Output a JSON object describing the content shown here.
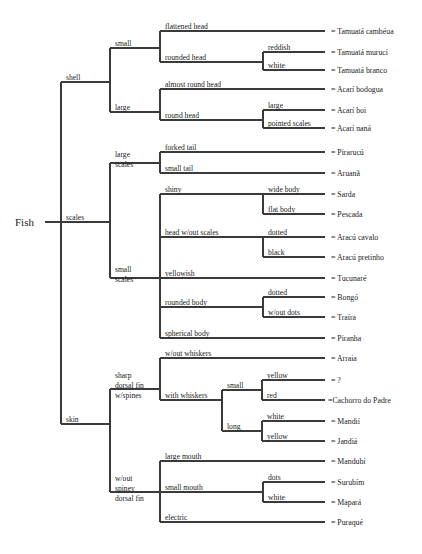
{
  "figure": {
    "root_label": "Fish",
    "leaf_prefix": "=",
    "caption": ""
  },
  "geometry": {
    "width": 422,
    "height": 554,
    "root_x": 61,
    "level_x": [
      61,
      110,
      160,
      263,
      300
    ],
    "leaf_line_end": 325,
    "leaf_text_x": 331,
    "root_text_x": 15,
    "root_y": 222
  },
  "levels": {
    "l1_label_x": 66,
    "l2_label_x": 115,
    "l3_label_x": 165,
    "l4_label_x": 268,
    "l5_label_x": 305
  },
  "branches": [
    {
      "id": "shell",
      "label": "shell",
      "label_x": 66,
      "y": 82,
      "spine_x": 110,
      "spine_top": 48,
      "spine_bottom": 112,
      "children": [
        {
          "id": "shell-small",
          "label": "small",
          "label_x": 115,
          "y": 48,
          "spine_x": 160,
          "spine_top": 31,
          "spine_bottom": 62,
          "children": [
            {
              "id": "flattened-head",
              "label": "flattened head",
              "label_x": 165,
              "y": 31,
              "leaf": "Tamuatá cambéua"
            },
            {
              "id": "rounded-head",
              "label": "rounded head",
              "label_x": 165,
              "y": 62,
              "spine_x": 263,
              "spine_top": 52,
              "spine_bottom": 70,
              "children": [
                {
                  "id": "reddish",
                  "label": "reddish",
                  "label_x": 268,
                  "y": 52,
                  "leaf": "Tamuatá murucí"
                },
                {
                  "id": "white-tamuata",
                  "label": "white",
                  "label_x": 268,
                  "y": 70,
                  "leaf": "Tamuatá branco"
                }
              ]
            }
          ]
        },
        {
          "id": "shell-large",
          "label": "large",
          "label_x": 115,
          "y": 112,
          "spine_x": 160,
          "spine_top": 89,
          "spine_bottom": 120,
          "children": [
            {
              "id": "almost-round-head",
              "label": "almost round head",
              "label_x": 165,
              "y": 89,
              "leaf": "Acarí  bodogua"
            },
            {
              "id": "round-head",
              "label": "round head",
              "label_x": 165,
              "y": 120,
              "spine_x": 263,
              "spine_top": 110,
              "spine_bottom": 128,
              "children": [
                {
                  "id": "acari-large",
                  "label": "large",
                  "label_x": 268,
                  "y": 110,
                  "leaf": "Acarí  boi"
                },
                {
                  "id": "pointed-scales",
                  "label": "pointed scales",
                  "label_x": 268,
                  "y": 128,
                  "leaf": "Acarí  naná"
                }
              ]
            }
          ]
        }
      ]
    },
    {
      "id": "scales",
      "label": "scales",
      "label_x": 66,
      "y": 222,
      "spine_x": 110,
      "spine_top": 163,
      "spine_bottom": 278,
      "children": [
        {
          "id": "large-scales",
          "label": "large\nscales",
          "label_x": 115,
          "y": 163,
          "spine_x": 160,
          "spine_top": 152,
          "spine_bottom": 173,
          "children": [
            {
              "id": "forked-tail",
              "label": "forked tail",
              "label_x": 165,
              "y": 152,
              "leaf": "Pirarucú"
            },
            {
              "id": "small-tail",
              "label": "small tail",
              "label_x": 165,
              "y": 173,
              "leaf": "Aruanã"
            }
          ]
        },
        {
          "id": "small-scales",
          "label": "small\nscales",
          "label_x": 115,
          "y": 278,
          "spine_x": 160,
          "spine_top": 194,
          "spine_bottom": 338,
          "children": [
            {
              "id": "shiny",
              "label": "shiny",
              "label_x": 165,
              "y": 194,
              "spine_x": 263,
              "spine_top": 194,
              "spine_bottom": 214,
              "children": [
                {
                  "id": "wide-body",
                  "label": "wide body",
                  "label_x": 268,
                  "y": 194,
                  "leaf": "Sarda"
                },
                {
                  "id": "flat-body",
                  "label": "flat body",
                  "label_x": 268,
                  "y": 214,
                  "leaf": "Pescada"
                }
              ]
            },
            {
              "id": "head-without-scales",
              "label": "head w/out scales",
              "label_x": 165,
              "y": 237,
              "spine_x": 263,
              "spine_top": 237,
              "spine_bottom": 257,
              "children": [
                {
                  "id": "dotted",
                  "label": "dotted",
                  "label_x": 268,
                  "y": 237,
                  "leaf": "Aracú  cavalo"
                },
                {
                  "id": "black",
                  "label": "black",
                  "label_x": 268,
                  "y": 257,
                  "leaf": "Aracú  pretinho"
                }
              ]
            },
            {
              "id": "yellowish",
              "label": "yellowish",
              "label_x": 165,
              "y": 278,
              "leaf": "Tucunaré"
            },
            {
              "id": "rounded-body",
              "label": "rounded body",
              "label_x": 165,
              "y": 307,
              "spine_x": 263,
              "spine_top": 297,
              "spine_bottom": 317,
              "children": [
                {
                  "id": "dotted-traira",
                  "label": "dotted",
                  "label_x": 268,
                  "y": 297,
                  "leaf": "Bongó"
                },
                {
                  "id": "without-dots",
                  "label": "w/out dots",
                  "label_x": 268,
                  "y": 317,
                  "leaf": "Traíra"
                }
              ]
            },
            {
              "id": "spherical-body",
              "label": "spherical body",
              "label_x": 165,
              "y": 338,
              "leaf": "Piranha"
            }
          ]
        }
      ]
    },
    {
      "id": "skin",
      "label": "skin",
      "label_x": 66,
      "y": 424,
      "spine_x": 110,
      "spine_top": 389,
      "spine_bottom": 492,
      "children": [
        {
          "id": "sharp-dorsal-fin",
          "label": "sharp\ndorsal fin\nw/spines",
          "label_x": 115,
          "y": 389,
          "spine_x": 160,
          "spine_top": 358,
          "spine_bottom": 400,
          "children": [
            {
              "id": "without-whiskers",
              "label": "w/out whiskers",
              "label_x": 165,
              "y": 358,
              "leaf": "Arraia"
            },
            {
              "id": "with-whiskers",
              "label": "with whiskers",
              "label_x": 165,
              "y": 400,
              "spine_x": 222,
              "spine_top": 390,
              "spine_bottom": 431,
              "children": [
                {
                  "id": "whisker-small",
                  "label": "small",
                  "label_x": 227,
                  "y": 390,
                  "spine_x": 262,
                  "spine_top": 380,
                  "spine_bottom": 400,
                  "children": [
                    {
                      "id": "yellow-unknown",
                      "label": "yellow",
                      "label_x": 267,
                      "y": 380,
                      "leaf": "?"
                    },
                    {
                      "id": "red",
                      "label": "red",
                      "label_x": 267,
                      "y": 400,
                      "leaf": "Cachorro do Padre",
                      "tight": true
                    }
                  ]
                },
                {
                  "id": "whisker-long",
                  "label": "long",
                  "label_x": 227,
                  "y": 431,
                  "spine_x": 262,
                  "spine_top": 421,
                  "spine_bottom": 441,
                  "children": [
                    {
                      "id": "white-mandii",
                      "label": "white",
                      "label_x": 267,
                      "y": 421,
                      "leaf": "Mandií"
                    },
                    {
                      "id": "yellow-jandia",
                      "label": "yellow",
                      "label_x": 267,
                      "y": 441,
                      "leaf": "Jandiá"
                    }
                  ]
                }
              ]
            }
          ]
        },
        {
          "id": "without-spiney-dorsal-fin",
          "label": "w/out\nspiney\ndorsal  fin",
          "label_x": 115,
          "y": 492,
          "spine_x": 160,
          "spine_top": 461,
          "spine_bottom": 522,
          "children": [
            {
              "id": "large-mouth",
              "label": "large mouth",
              "label_x": 165,
              "y": 461,
              "leaf": "Mandubí"
            },
            {
              "id": "small-mouth",
              "label": "small mouth",
              "label_x": 165,
              "y": 492,
              "spine_x": 263,
              "spine_top": 482,
              "spine_bottom": 502,
              "children": [
                {
                  "id": "dots",
                  "label": "dots",
                  "label_x": 268,
                  "y": 482,
                  "leaf": "Surubím"
                },
                {
                  "id": "white-mapara",
                  "label": "white",
                  "label_x": 268,
                  "y": 502,
                  "leaf": "Mapará"
                }
              ]
            },
            {
              "id": "electric",
              "label": "electric",
              "label_x": 165,
              "y": 522,
              "leaf": "Puraqué"
            }
          ]
        }
      ]
    }
  ]
}
